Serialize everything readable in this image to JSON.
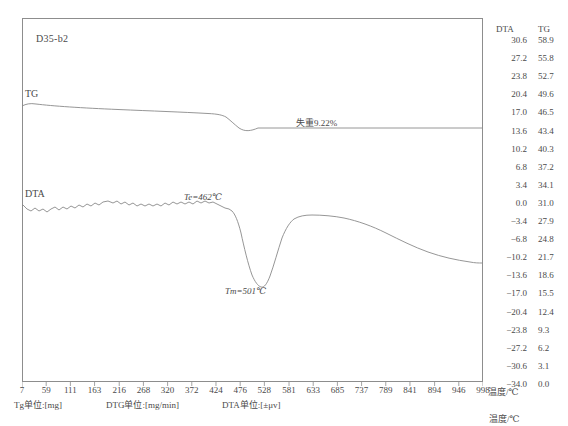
{
  "sample": {
    "id": "D35-b2"
  },
  "curve_labels": {
    "tg": "TG",
    "dta": "DTA"
  },
  "annotations": {
    "weight_loss": "失重9.22%",
    "onset": "Te=462℃",
    "peak": "Tm=501℃"
  },
  "axes": {
    "x_title": "温度/℃",
    "right_headers": {
      "dta": "DTA",
      "tg": "TG"
    },
    "temp_axis_caption": "温度/℃",
    "units": {
      "tg": "Tg单位:[mg]",
      "dtg": "DTG单位:[mg/min]",
      "dta": "DTA单位:[±μv]"
    }
  },
  "chart_data": {
    "type": "line",
    "title": "D35-b2",
    "xlabel": "温度/℃",
    "ylabel_left": "",
    "ylabel_right_dta": "DTA",
    "ylabel_right_tg": "TG",
    "grid": false,
    "legend": "inline-curve-labels",
    "xlim": [
      7,
      998
    ],
    "x_ticks": [
      7,
      59,
      111,
      163,
      216,
      268,
      320,
      372,
      424,
      476,
      528,
      581,
      633,
      685,
      737,
      789,
      841,
      894,
      946,
      998
    ],
    "dta_axis": {
      "label": "DTA",
      "unit": "±μv",
      "ticks": [
        30.6,
        27.2,
        23.8,
        20.4,
        17.0,
        13.6,
        10.2,
        6.8,
        3.4,
        0.0,
        -3.4,
        -6.8,
        -10.2,
        -13.6,
        -17.0,
        -20.4,
        -23.8,
        -27.2,
        -30.6,
        -34.0
      ],
      "lim": [
        -34.0,
        30.6
      ]
    },
    "tg_axis": {
      "label": "TG",
      "unit": "mg",
      "ticks": [
        58.9,
        55.8,
        52.7,
        49.6,
        46.5,
        43.4,
        40.3,
        37.2,
        34.1,
        31.0,
        27.9,
        24.8,
        21.7,
        18.6,
        15.5,
        12.4,
        9.3,
        6.2,
        3.1,
        0.0
      ],
      "lim": [
        0.0,
        58.9
      ]
    },
    "series": [
      {
        "name": "TG",
        "axis": "tg",
        "units": "mg",
        "x": [
          7,
          40,
          80,
          130,
          180,
          230,
          280,
          330,
          380,
          424,
          450,
          462,
          476,
          490,
          501,
          515,
          528,
          560,
          600,
          660,
          720,
          790,
          860,
          930,
          998
        ],
        "y": [
          49.9,
          49.7,
          49.6,
          49.5,
          49.4,
          49.3,
          49.2,
          49.1,
          49.0,
          48.9,
          48.7,
          48.4,
          47.5,
          46.3,
          45.6,
          45.1,
          44.9,
          44.8,
          44.8,
          44.8,
          44.8,
          44.8,
          44.8,
          44.8,
          44.8
        ]
      },
      {
        "name": "DTA",
        "axis": "dta",
        "units": "uv",
        "x": [
          7,
          30,
          55,
          80,
          105,
          130,
          155,
          180,
          205,
          230,
          255,
          280,
          305,
          330,
          355,
          380,
          405,
          424,
          440,
          455,
          462,
          470,
          480,
          490,
          501,
          510,
          520,
          528,
          545,
          565,
          585,
          620,
          660,
          700,
          740,
          790,
          840,
          890,
          940,
          998
        ],
        "y": [
          1.2,
          0.3,
          0.6,
          1.0,
          0.7,
          1.1,
          0.8,
          1.3,
          1.6,
          1.2,
          1.5,
          1.2,
          1.5,
          1.2,
          1.6,
          1.3,
          1.7,
          1.5,
          1.5,
          1.2,
          0.9,
          0.2,
          -4.0,
          -9.5,
          -13.3,
          -11.0,
          -5.5,
          -0.5,
          1.9,
          2.2,
          2.1,
          1.9,
          1.5,
          0.8,
          0.0,
          -1.4,
          -2.8,
          -4.1,
          -5.2,
          -5.9
        ]
      }
    ],
    "annotations": [
      {
        "text": "失重9.22%",
        "x": 640,
        "axis": "tg",
        "note": "mass loss of TG step"
      },
      {
        "text": "Te=462℃",
        "x": 462,
        "axis": "dta",
        "note": "endothermic onset temperature"
      },
      {
        "text": "Tm=501℃",
        "x": 501,
        "axis": "dta",
        "note": "endothermic peak temperature"
      }
    ]
  }
}
